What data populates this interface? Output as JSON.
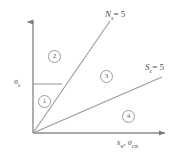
{
  "figure": {
    "type": "schematic-diagram",
    "background_color": "#ffffff",
    "line_color": "#8c8c8c",
    "text_color": "#4a4a4a",
    "axes": {
      "origin": {
        "x": 33,
        "y": 133
      },
      "y_axis": {
        "top_y": 16,
        "arrow": true
      },
      "x_axis": {
        "right_x": 172,
        "arrow": true
      },
      "y_axis_tick_label": {
        "symbol": "σ",
        "subscript": "s",
        "value_y": 84
      },
      "x_axis_label_parts": [
        {
          "symbol": "s",
          "subscript": "w"
        },
        {
          "symbol": "σ",
          "subscript": "cm"
        }
      ],
      "x_axis_label_separator": ","
    },
    "lines": [
      {
        "name": "steep-line",
        "label_symbol": "N",
        "label_subscript": "s",
        "label_equals": "= 5",
        "from": {
          "x": 33,
          "y": 133
        },
        "to": {
          "x": 110,
          "y": 21
        }
      },
      {
        "name": "shallow-line",
        "label_symbol": "S",
        "label_subscript": "c",
        "label_equals": "= 5",
        "from": {
          "x": 33,
          "y": 133
        },
        "to": {
          "x": 162,
          "y": 77
        }
      }
    ],
    "reference_line": {
      "name": "sigma-s-horizontal",
      "from": {
        "x": 33,
        "y": 84
      },
      "to": {
        "x": 62,
        "y": 84
      }
    },
    "regions": [
      {
        "id": "1",
        "glyph": "①",
        "number": "1",
        "x": 38,
        "y": 95
      },
      {
        "id": "2",
        "glyph": "②",
        "number": "2",
        "x": 48,
        "y": 50
      },
      {
        "id": "3",
        "glyph": "③",
        "number": "3",
        "x": 100,
        "y": 70
      },
      {
        "id": "4",
        "glyph": "④",
        "number": "4",
        "x": 122,
        "y": 110
      }
    ]
  },
  "labels": {
    "curve_ns": {
      "symbol": "N",
      "subscript": "s",
      "equals": "= 5"
    },
    "curve_sc": {
      "symbol": "S",
      "subscript": "c",
      "equals": "= 5"
    },
    "y_tick": {
      "symbol": "σ",
      "subscript": "s"
    },
    "x_axis_first": {
      "symbol": "s",
      "subscript": "w"
    },
    "x_axis_comma": ",",
    "x_axis_second": {
      "symbol": "σ",
      "subscript": "cm"
    }
  }
}
